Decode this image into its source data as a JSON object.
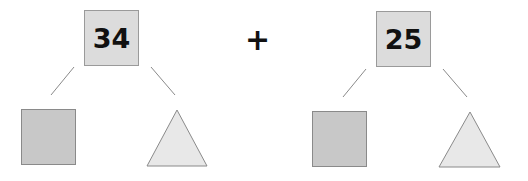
{
  "diagram": {
    "operator": "+",
    "left": {
      "number": "34",
      "parts": [
        "square",
        "triangle"
      ]
    },
    "right": {
      "number": "25",
      "parts": [
        "square",
        "triangle"
      ]
    },
    "colors": {
      "number_box": "#dcdcdc",
      "square": "#c8c8c8",
      "triangle": "#e8e8e8",
      "stroke": "#8a8a8a"
    }
  }
}
